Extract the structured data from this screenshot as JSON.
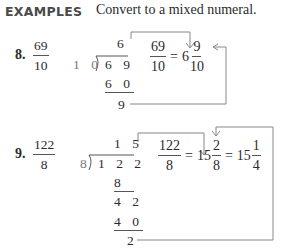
{
  "header": {
    "label": "EXAMPLES",
    "instruction": "Convert to a mixed numeral."
  },
  "examples": [
    {
      "number": "8.",
      "fraction": {
        "numerator": "69",
        "denominator": "10"
      },
      "long_division": {
        "divisor": "1 0",
        "dividend": "6 9",
        "quotient": "6",
        "steps": [
          "6 0"
        ],
        "remainder": "9"
      },
      "result": {
        "lhs": {
          "numerator": "69",
          "denominator": "10"
        },
        "equals": "=",
        "mixed": {
          "whole": "6",
          "numerator": "9",
          "denominator": "10"
        }
      }
    },
    {
      "number": "9.",
      "fraction": {
        "numerator": "122",
        "denominator": "8"
      },
      "long_division": {
        "divisor": "8",
        "dividend": "1 2 2",
        "quotient": "1 5",
        "steps": [
          "8",
          "4 2",
          "4 0"
        ],
        "remainder": "2"
      },
      "result": {
        "lhs": {
          "numerator": "122",
          "denominator": "8"
        },
        "equals": "=",
        "mixed": {
          "whole": "15",
          "numerator": "2",
          "denominator": "8"
        },
        "equals2": "=",
        "simplified": {
          "whole": "15",
          "numerator": "1",
          "denominator": "4"
        }
      }
    }
  ],
  "colors": {
    "text": "#2b2b2b",
    "header_label": "#4a4a4a",
    "arrow_lines": "#777777"
  }
}
